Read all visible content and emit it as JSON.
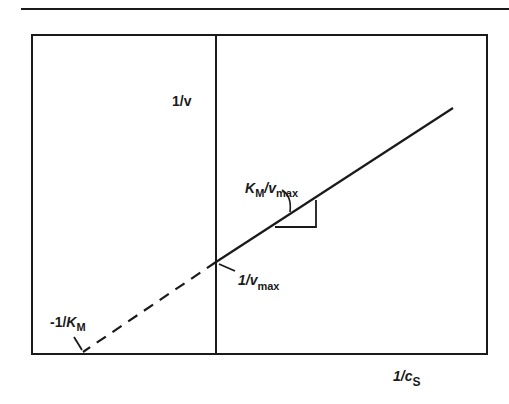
{
  "diagram": {
    "type": "Lineweaver-Burk plot",
    "y_axis_label": {
      "main": "1/v"
    },
    "x_axis_label": {
      "main": "1/c",
      "sub": "S"
    },
    "slope_label": {
      "k": "K",
      "k_sub": "M",
      "sep": "/v",
      "v_sub": "max"
    },
    "y_intercept_label": {
      "main": "1/v",
      "sub": "max"
    },
    "x_intercept_label": {
      "prefix": "-1/",
      "k": "K",
      "k_sub": "M"
    },
    "colors": {
      "ink": "#1a1a1a",
      "background": "#ffffff"
    }
  }
}
